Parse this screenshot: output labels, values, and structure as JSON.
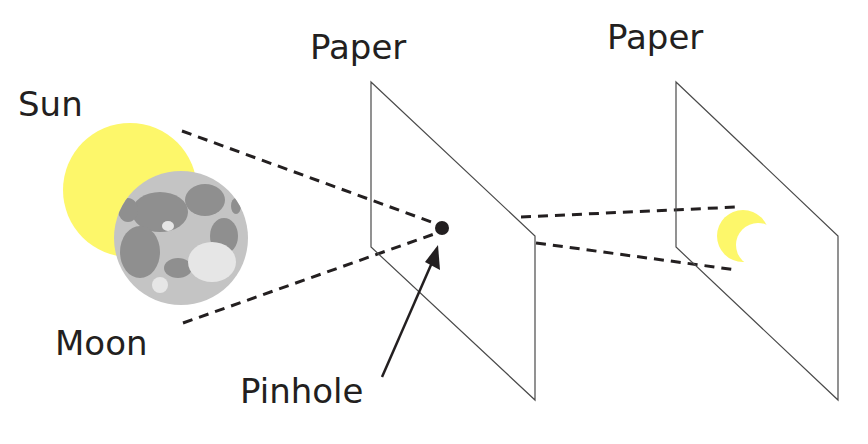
{
  "diagram": {
    "labels": {
      "sun": "Sun",
      "moon": "Moon",
      "paper_1": "Paper",
      "paper_2": "Paper",
      "pinhole": "Pinhole"
    },
    "colors": {
      "sun_fill": "#fdf76a",
      "moon_base": "#bdbdbd",
      "moon_dark": "#8a8a8a",
      "line": "#231f20",
      "paper_edge": "#4a4a4a",
      "background": "#ffffff"
    },
    "elements": [
      {
        "id": "sun",
        "shape": "circle",
        "partially_covered_by": "moon"
      },
      {
        "id": "moon",
        "shape": "circle"
      },
      {
        "id": "paper_1",
        "shape": "parallelogram",
        "has": "pinhole"
      },
      {
        "id": "pinhole",
        "shape": "dot"
      },
      {
        "id": "paper_2",
        "shape": "parallelogram",
        "has": "projected crescent"
      },
      {
        "id": "projected_crescent",
        "shape": "crescent",
        "note": "inverted image of eclipsed sun"
      }
    ],
    "rays": [
      {
        "from": "sun top",
        "to": "pinhole",
        "style": "dashed"
      },
      {
        "from": "moon bottom",
        "to": "pinhole",
        "style": "dashed"
      },
      {
        "from": "pinhole",
        "to": "crescent top",
        "style": "dashed"
      },
      {
        "from": "pinhole",
        "to": "crescent bottom",
        "style": "dashed"
      }
    ]
  }
}
